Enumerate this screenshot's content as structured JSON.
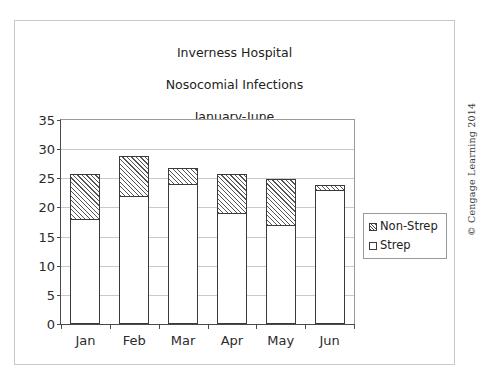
{
  "figure": {
    "title_lines": [
      "Inverness Hospital",
      "Nosocomial Infections",
      "January-June"
    ],
    "credit": "© Cengage Learning 2014"
  },
  "legend": {
    "position": "right",
    "items": [
      {
        "label": "Non-Strep",
        "swatch": "hatched-swatch-icon"
      },
      {
        "label": "Strep",
        "swatch": "white-swatch-icon"
      }
    ]
  },
  "axes": {
    "y_ticks": [
      "35",
      "30",
      "25",
      "20",
      "15",
      "10",
      "5",
      "0"
    ],
    "x_ticks": [
      "Jan",
      "Feb",
      "Mar",
      "Apr",
      "May",
      "Jun"
    ]
  },
  "chart_data": {
    "type": "bar",
    "stacked": true,
    "title": "Inverness Hospital Nosocomial Infections January-June",
    "subtitle": "January-June",
    "xlabel": "",
    "ylabel": "",
    "categories": [
      "Jan",
      "Feb",
      "Mar",
      "Apr",
      "May",
      "Jun"
    ],
    "series": [
      {
        "name": "Strep",
        "values": [
          18,
          22,
          24,
          19,
          17,
          23
        ]
      },
      {
        "name": "Non-Strep",
        "values": [
          8,
          7,
          3,
          7,
          8,
          1
        ]
      }
    ],
    "totals": [
      26,
      29,
      27,
      26,
      25,
      24
    ],
    "ylim": [
      0,
      35
    ],
    "ytick_step": 5,
    "grid": true,
    "legend_position": "right"
  },
  "colors": {
    "bar_outline": "#3a3a3a",
    "strep_fill": "#ffffff",
    "nonstrep_hatch": "#555555",
    "gridline": "#c9c9c9",
    "axis": "#4a4a4a",
    "frame": "#c8c8c8",
    "text": "#222222"
  }
}
